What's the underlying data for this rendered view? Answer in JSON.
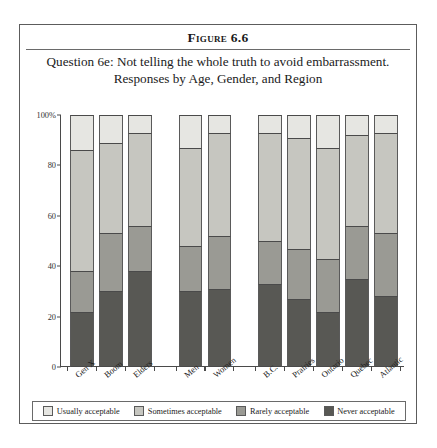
{
  "figure": {
    "number": "Figure 6.6",
    "caption_line1": "Question 6e: Not telling the whole truth to avoid embarrassment.",
    "caption_line2": "Responses by Age, Gender, and Region"
  },
  "colors": {
    "usually_acceptable": "#e6e6e2",
    "sometimes_acceptable": "#c6c6c0",
    "rarely_acceptable": "#9a9a94",
    "never_acceptable": "#585854",
    "axis": "#4a4a4a",
    "frame": "#5c5c5c",
    "text": "#1a1a1a"
  },
  "legend": {
    "position": "bottom",
    "items": [
      {
        "label": "Usually acceptable",
        "color": "#e6e6e2",
        "key": "usually"
      },
      {
        "label": "Sometimes acceptable",
        "color": "#c6c6c0",
        "key": "sometimes"
      },
      {
        "label": "Rarely acceptable",
        "color": "#9a9a94",
        "key": "rarely"
      },
      {
        "label": "Never acceptable",
        "color": "#585854",
        "key": "never"
      }
    ]
  },
  "chart_data": {
    "type": "bar",
    "subtype": "stacked-vertical-percent",
    "title": "Question 6e: Not telling the whole truth to avoid embarrassment.",
    "subtitle": "Responses by Age, Gender, and Region",
    "xlabel": "",
    "ylabel": "",
    "ylim": [
      0,
      100
    ],
    "yticks": [
      0,
      20,
      40,
      60,
      80,
      100
    ],
    "ytick_labels": [
      "0",
      "20",
      "40",
      "60",
      "80",
      "100%"
    ],
    "grid": false,
    "legend_position": "bottom",
    "categories": [
      "Gen X",
      "Boom",
      "Elders",
      "Men",
      "Women",
      "B.C.",
      "Prairies",
      "Ontario",
      "Quebec",
      "Atlantic"
    ],
    "groups": [
      {
        "name": "Age",
        "categories": [
          "Gen X",
          "Boom",
          "Elders"
        ]
      },
      {
        "name": "Gender",
        "categories": [
          "Men",
          "Women"
        ]
      },
      {
        "name": "Region",
        "categories": [
          "B.C.",
          "Prairies",
          "Ontario",
          "Quebec",
          "Atlantic"
        ]
      }
    ],
    "series": [
      {
        "name": "Never acceptable",
        "color": "#585854",
        "values": [
          22,
          30,
          38,
          30,
          31,
          33,
          27,
          22,
          35,
          28
        ]
      },
      {
        "name": "Rarely acceptable",
        "color": "#9a9a94",
        "values": [
          16,
          23,
          18,
          18,
          21,
          17,
          20,
          21,
          21,
          25
        ]
      },
      {
        "name": "Sometimes acceptable",
        "color": "#c6c6c0",
        "values": [
          48,
          36,
          37,
          39,
          41,
          43,
          44,
          44,
          36,
          40
        ]
      },
      {
        "name": "Usually acceptable",
        "color": "#e6e6e2",
        "values": [
          14,
          11,
          7,
          13,
          7,
          7,
          9,
          13,
          8,
          7
        ]
      }
    ],
    "cumulative_tops": {
      "never": [
        22,
        30,
        38,
        30,
        31,
        33,
        27,
        22,
        35,
        28
      ],
      "rarely": [
        38,
        53,
        56,
        48,
        52,
        50,
        47,
        43,
        56,
        53
      ],
      "sometimes": [
        86,
        89,
        93,
        87,
        93,
        93,
        91,
        87,
        92,
        93
      ],
      "usually": [
        100,
        100,
        100,
        100,
        100,
        100,
        100,
        100,
        100,
        100
      ]
    }
  }
}
